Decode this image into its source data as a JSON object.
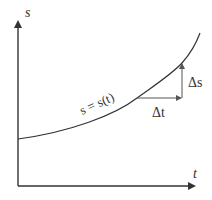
{
  "diagram": {
    "axes": {
      "y_label": "s",
      "x_label": "t"
    },
    "curve": {
      "label": "s = s(t)"
    },
    "triangle": {
      "horizontal_label": "Δt",
      "vertical_label": "Δs"
    },
    "colors": {
      "stroke": "#333333",
      "background": "#ffffff"
    }
  }
}
